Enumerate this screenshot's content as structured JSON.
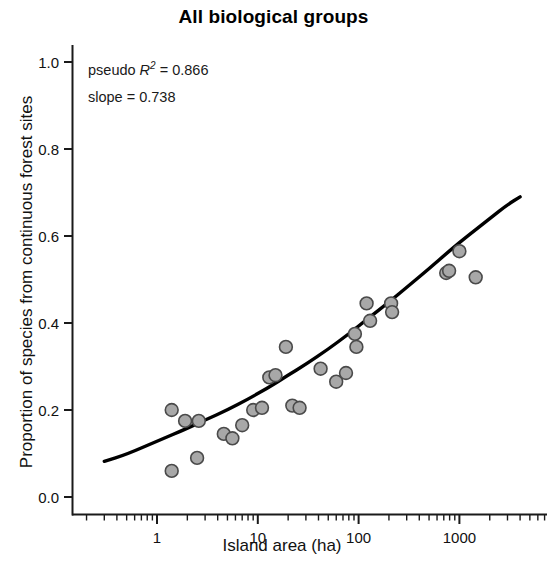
{
  "chart_data": {
    "type": "scatter",
    "title": "All biological groups",
    "xlabel": "Island area (ha)",
    "ylabel": "Proportion of species from continuous forest sites",
    "xscale": "log",
    "yscale": "linear",
    "xlim": [
      0.3,
      5000
    ],
    "ylim": [
      0.0,
      1.0
    ],
    "grid": false,
    "legend": null,
    "x_tick_labels": [
      "1",
      "10",
      "100",
      "1000"
    ],
    "x_tick_values": [
      1,
      10,
      100,
      1000
    ],
    "y_tick_labels": [
      "0.0",
      "0.2",
      "0.4",
      "0.6",
      "0.8",
      "1.0"
    ],
    "y_tick_values": [
      0.0,
      0.2,
      0.4,
      0.6,
      0.8,
      1.0
    ],
    "marker_fill": "#a8a8a8",
    "marker_edge": "#4a4a4a",
    "line_color": "#000000",
    "annotations": [
      {
        "label": "pseudo R²",
        "value": "0.866",
        "text": "pseudo R2 = 0.866"
      },
      {
        "label": "slope",
        "value": "0.738",
        "text": "slope = 0.738"
      }
    ],
    "points": [
      {
        "x": 1.4,
        "y": 0.2
      },
      {
        "x": 1.4,
        "y": 0.06
      },
      {
        "x": 1.9,
        "y": 0.175
      },
      {
        "x": 2.6,
        "y": 0.175
      },
      {
        "x": 2.5,
        "y": 0.09
      },
      {
        "x": 4.6,
        "y": 0.145
      },
      {
        "x": 5.6,
        "y": 0.135
      },
      {
        "x": 7.0,
        "y": 0.165
      },
      {
        "x": 9.0,
        "y": 0.2
      },
      {
        "x": 11.0,
        "y": 0.205
      },
      {
        "x": 13.0,
        "y": 0.275
      },
      {
        "x": 15.0,
        "y": 0.28
      },
      {
        "x": 19.0,
        "y": 0.345
      },
      {
        "x": 22.0,
        "y": 0.21
      },
      {
        "x": 26.0,
        "y": 0.205
      },
      {
        "x": 42.0,
        "y": 0.295
      },
      {
        "x": 60.0,
        "y": 0.265
      },
      {
        "x": 75.0,
        "y": 0.285
      },
      {
        "x": 92.0,
        "y": 0.375
      },
      {
        "x": 95.0,
        "y": 0.345
      },
      {
        "x": 120.0,
        "y": 0.445
      },
      {
        "x": 130.0,
        "y": 0.405
      },
      {
        "x": 210.0,
        "y": 0.445
      },
      {
        "x": 215.0,
        "y": 0.425
      },
      {
        "x": 740.0,
        "y": 0.515
      },
      {
        "x": 790.0,
        "y": 0.52
      },
      {
        "x": 1000.0,
        "y": 0.565
      },
      {
        "x": 1450.0,
        "y": 0.505
      }
    ],
    "fit_curve": [
      {
        "x": 0.3,
        "y": 0.082
      },
      {
        "x": 0.5,
        "y": 0.098
      },
      {
        "x": 1.0,
        "y": 0.128
      },
      {
        "x": 2.0,
        "y": 0.158
      },
      {
        "x": 3.0,
        "y": 0.177
      },
      {
        "x": 5.0,
        "y": 0.2
      },
      {
        "x": 8.0,
        "y": 0.225
      },
      {
        "x": 12.0,
        "y": 0.248
      },
      {
        "x": 20.0,
        "y": 0.28
      },
      {
        "x": 30.0,
        "y": 0.305
      },
      {
        "x": 50.0,
        "y": 0.34
      },
      {
        "x": 80.0,
        "y": 0.375
      },
      {
        "x": 120.0,
        "y": 0.408
      },
      {
        "x": 200.0,
        "y": 0.448
      },
      {
        "x": 300.0,
        "y": 0.482
      },
      {
        "x": 500.0,
        "y": 0.525
      },
      {
        "x": 800.0,
        "y": 0.566
      },
      {
        "x": 1200.0,
        "y": 0.6
      },
      {
        "x": 2000.0,
        "y": 0.64
      },
      {
        "x": 3000.0,
        "y": 0.672
      },
      {
        "x": 4000.0,
        "y": 0.69
      }
    ]
  }
}
